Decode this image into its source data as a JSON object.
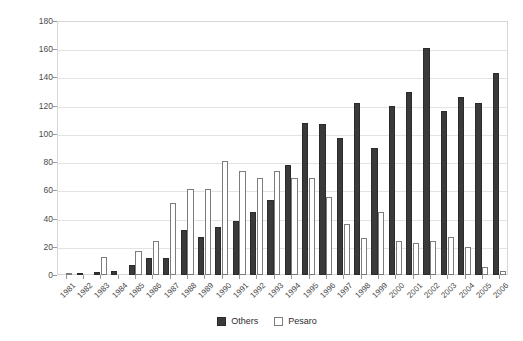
{
  "chart_data": {
    "type": "bar",
    "title": "",
    "subtitle": "",
    "xlabel": "",
    "ylabel": "Transplants / year",
    "ylim": [
      0,
      180
    ],
    "ytick_step": 20,
    "yticks": [
      0,
      20,
      40,
      60,
      80,
      100,
      120,
      140,
      160,
      180
    ],
    "grid": true,
    "legend_position": "bottom",
    "categories": [
      "1981",
      "1982",
      "1983",
      "1984",
      "1985",
      "1986",
      "1987",
      "1988",
      "1989",
      "1990",
      "1991",
      "1992",
      "1993",
      "1994",
      "1995",
      "1996",
      "1997",
      "1998",
      "1999",
      "2000",
      "2001",
      "2002",
      "2003",
      "2004",
      "2005",
      "2006"
    ],
    "series": [
      {
        "name": "Others",
        "color": "#3a3a3a",
        "values": [
          0,
          1,
          2,
          3,
          7,
          12,
          12,
          32,
          27,
          34,
          38,
          45,
          53,
          78,
          108,
          107,
          97,
          122,
          90,
          120,
          130,
          161,
          116,
          126,
          122,
          143
        ]
      },
      {
        "name": "Pesaro",
        "color": "#ffffff",
        "values": [
          1,
          0,
          13,
          0,
          17,
          24,
          51,
          61,
          61,
          81,
          74,
          69,
          74,
          69,
          69,
          55,
          36,
          26,
          45,
          24,
          23,
          24,
          27,
          20,
          6,
          3
        ]
      }
    ]
  },
  "legend": {
    "entries": [
      {
        "label": "Others",
        "swatch": "filled-dark-square"
      },
      {
        "label": "Pesaro",
        "swatch": "outlined-white-square"
      }
    ]
  },
  "axes": {
    "y_title": "Transplants / year"
  },
  "colors": {
    "others": "#3a3a3a",
    "pesaro": "#ffffff",
    "pesaro_border": "#7c7c7c",
    "grid": "#e3e3e3",
    "frame": "#d6d6d6",
    "text": "#4a4a4a"
  }
}
